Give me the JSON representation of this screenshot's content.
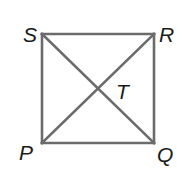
{
  "diagram": {
    "type": "square with diagonals",
    "stroke_color": "#6b6b6b",
    "label_color": "#1a1a1a",
    "vertices": [
      {
        "name": "S",
        "x": 42,
        "y": 34
      },
      {
        "name": "R",
        "x": 154,
        "y": 34
      },
      {
        "name": "Q",
        "x": 154,
        "y": 143
      },
      {
        "name": "P",
        "x": 42,
        "y": 143
      }
    ],
    "segments": [
      [
        "S",
        "R"
      ],
      [
        "R",
        "Q"
      ],
      [
        "Q",
        "P"
      ],
      [
        "P",
        "S"
      ],
      [
        "S",
        "Q"
      ],
      [
        "P",
        "R"
      ]
    ],
    "intersection": {
      "name": "T",
      "x": 98,
      "y": 88
    },
    "labels": {
      "S": "S",
      "R": "R",
      "P": "P",
      "Q": "Q",
      "T": "T"
    }
  }
}
